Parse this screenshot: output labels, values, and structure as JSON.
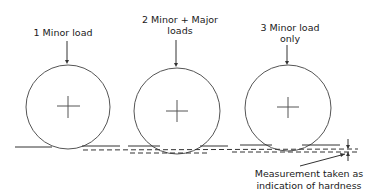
{
  "diagram": {
    "stages": [
      {
        "step": 1,
        "label_line1": "1 Minor  load",
        "label_line2": ""
      },
      {
        "step": 2,
        "label_line1": "2 Minor + Major",
        "label_line2": "loads"
      },
      {
        "step": 3,
        "label_line1": "3 Minor  load",
        "label_line2": "only"
      }
    ],
    "caption": {
      "line1": "Measurement taken as",
      "line2": "indication of hardness"
    },
    "colors": {
      "stroke": "#333333",
      "background": "#ffffff"
    }
  }
}
